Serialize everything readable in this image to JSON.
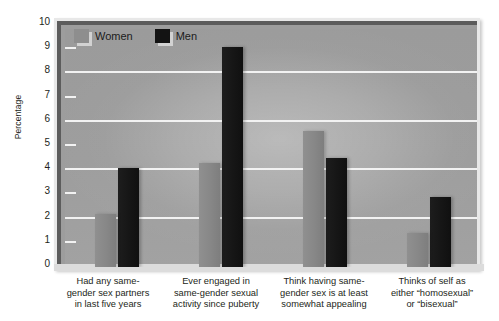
{
  "chart_data": {
    "type": "bar",
    "title": "",
    "subtitle": "",
    "xlabel": "",
    "ylabel": "Percentage",
    "ylim": [
      0,
      10
    ],
    "ytick_values": [
      0,
      1,
      2,
      3,
      4,
      5,
      6,
      7,
      8,
      9,
      10
    ],
    "ytick_labels": [
      "0",
      "1",
      "2",
      "3",
      "4",
      "5",
      "6",
      "7",
      "8",
      "9",
      "10"
    ],
    "gridlines_at": [
      2,
      4,
      6,
      8
    ],
    "ticks_at": [
      1,
      3,
      5,
      7,
      9
    ],
    "grid": true,
    "legend_position": "top-left",
    "categories": [
      "Had any same-gender sex partners in last five years",
      "Ever engaged in same-gender sexual activity since puberty",
      "Think having same-gender sex is at least somewhat appealing",
      "Thinks of self as either “homosexual” or “bisexual”"
    ],
    "category_lines": [
      [
        "Had any same-",
        "gender sex partners",
        "in last five years"
      ],
      [
        "Ever engaged in",
        "same-gender sexual",
        "activity since puberty"
      ],
      [
        "Think having same-",
        "gender sex is at least",
        "somewhat appealing"
      ],
      [
        "Thinks of self as",
        "either “homosexual”",
        "or “bisexual”"
      ]
    ],
    "series": [
      {
        "name": "Women",
        "color": "#8a8a8a",
        "values": [
          2.2,
          4.3,
          5.6,
          1.4
        ]
      },
      {
        "name": "Men",
        "color": "#141414",
        "values": [
          4.1,
          9.1,
          4.5,
          2.9
        ]
      }
    ]
  },
  "legend": {
    "women_label": "Women",
    "men_label": "Men"
  },
  "colors": {
    "women_bar": "#8a8a8a",
    "men_bar": "#141414",
    "plot_background": "#9d9d9d",
    "gridline": "#f2f2f2",
    "axis_border": "#5c5c5c",
    "text": "#231f20"
  }
}
